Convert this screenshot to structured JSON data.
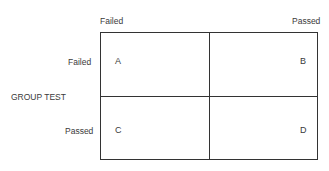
{
  "column_headers": {
    "left": "Failed",
    "right": "Passed"
  },
  "row_axis_label": "GROUP TEST",
  "row_headers": {
    "top": "Failed",
    "bottom": "Passed"
  },
  "cells": {
    "top_left": "A",
    "top_right": "B",
    "bottom_left": "C",
    "bottom_right": "D"
  }
}
